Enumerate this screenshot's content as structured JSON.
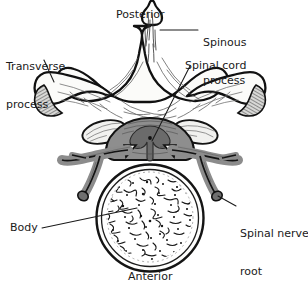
{
  "figure": {
    "kind": "anatomical-illustration",
    "background_color": "#ffffff",
    "ink_color": "#1a1a1a",
    "bone_fill": "#fbfbf9",
    "cord_fill": "#8f8f8f",
    "cord_gray_matter": "#6f6f6f",
    "nerve_fill": "#8c8c8c",
    "facet_fill": "#efefee"
  },
  "labels": [
    {
      "id": "posterior",
      "text": "Posterior",
      "x": 116,
      "y": 9,
      "leader": false
    },
    {
      "id": "spinous-process",
      "text": "Spinous\nprocess",
      "line1": "Spinous",
      "line2": "process",
      "x": 203,
      "y": 12,
      "leader": true
    },
    {
      "id": "transverse-process",
      "text": "Transverse\nprocess",
      "line1": "Transverse",
      "line2": "process",
      "x": 6,
      "y": 36,
      "leader": true
    },
    {
      "id": "spinal-cord",
      "text": "Spinal cord",
      "x": 185,
      "y": 60,
      "leader": true
    },
    {
      "id": "spinal-nerve-root",
      "text": "Spinal nerve\nroot",
      "line1": "Spinal nerve",
      "line2": "root",
      "x": 240,
      "y": 203,
      "leader": true
    },
    {
      "id": "body",
      "text": "Body",
      "x": 10,
      "y": 224,
      "leader": true
    },
    {
      "id": "anterior",
      "text": "Anterior",
      "x": 128,
      "y": 271,
      "leader": false
    }
  ],
  "structures": [
    {
      "id": "spinous-process",
      "name": "Spinous process"
    },
    {
      "id": "transverse-process-left",
      "name": "Transverse process (left)"
    },
    {
      "id": "transverse-process-right",
      "name": "Transverse process (right)"
    },
    {
      "id": "lamina",
      "name": "Lamina"
    },
    {
      "id": "spinal-cord",
      "name": "Spinal cord"
    },
    {
      "id": "spinal-nerve-root-left",
      "name": "Spinal nerve root (left)"
    },
    {
      "id": "spinal-nerve-root-right",
      "name": "Spinal nerve root (right)"
    },
    {
      "id": "vertebral-body",
      "name": "Vertebral body"
    },
    {
      "id": "trabecular-bone",
      "name": "Trabecular bone texture"
    }
  ]
}
